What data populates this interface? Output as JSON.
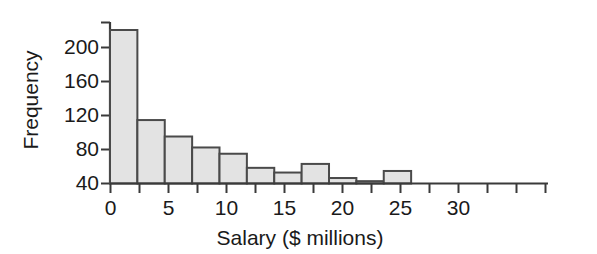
{
  "chart_data": {
    "type": "bar",
    "title": "",
    "subtitle": "",
    "xlabel": "Salary ($ millions)",
    "ylabel": "Frequency",
    "bin_width": 2,
    "bin_edges": [
      0,
      2,
      4,
      6,
      8,
      10,
      12,
      14,
      16,
      18,
      20,
      22
    ],
    "categories": [
      "0-2",
      "2-4",
      "4-6",
      "6-8",
      "8-10",
      "10-12",
      "12-14",
      "14-16",
      "16-18",
      "18-20",
      "20-22"
    ],
    "values": [
      196,
      81,
      60,
      46,
      38,
      20,
      14,
      25,
      7,
      3,
      16
    ],
    "xlim": [
      0,
      32
    ],
    "ylim": [
      0,
      205
    ],
    "x_ticks_major": [
      0,
      5,
      10,
      15,
      20,
      25,
      30
    ],
    "x_ticks_minor": [
      2.5,
      7.5,
      12.5,
      17.5,
      22.5,
      27.5
    ],
    "x_tick_labels": [
      "0",
      "5",
      "10",
      "15",
      "20",
      "25",
      "30"
    ],
    "y_ticks": [
      40,
      80,
      120,
      160,
      200
    ],
    "y_tick_labels": [
      "40",
      "80",
      "120",
      "160",
      "200"
    ],
    "grid": false,
    "legend": false,
    "legend_position": "none",
    "bar_fill_color": "#e3e3e3",
    "bar_edge_color": "#4a4a4a",
    "axis_color": "#3a3a3a"
  }
}
